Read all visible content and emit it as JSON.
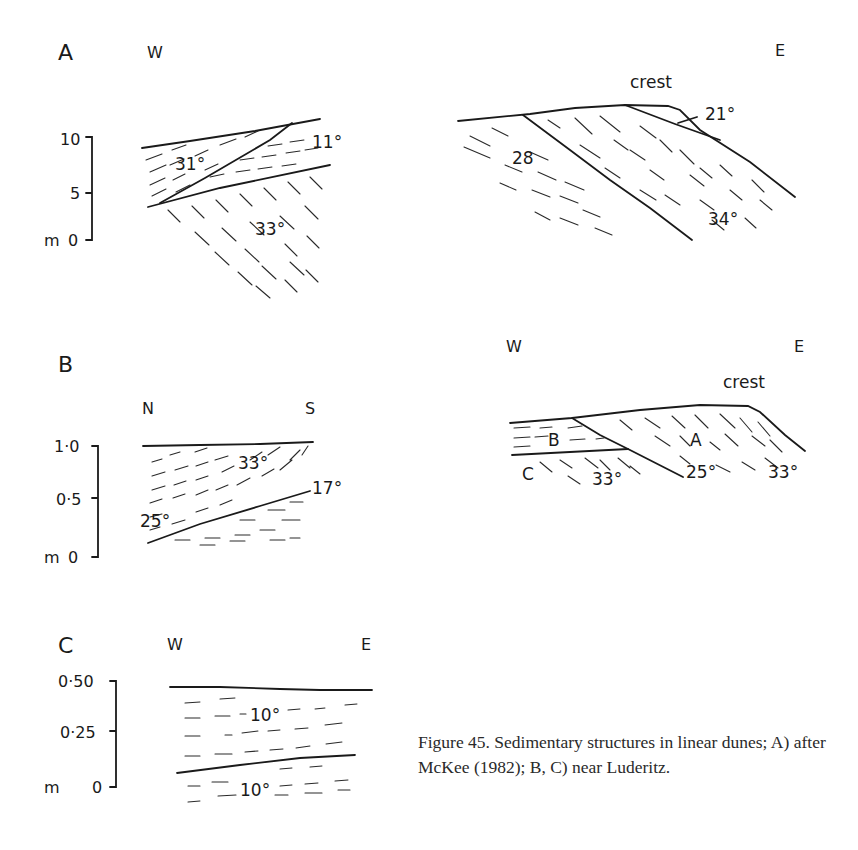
{
  "figure": {
    "caption": "Figure 45. Sedimentary structures in linear dunes; A) after McKee (1982); B, C) near Luderitz.",
    "panels": {
      "A": {
        "label": "A",
        "left_section": {
          "dir_left": "W",
          "scale": {
            "unit": "m",
            "ticks": [
              "10",
              "5",
              "0"
            ]
          },
          "angles": [
            "31°",
            "11°",
            "33°"
          ]
        },
        "right_section": {
          "dir_right": "E",
          "crest_label": "crest",
          "angles": [
            "28",
            "21°",
            "34°"
          ]
        }
      },
      "B": {
        "label": "B",
        "left_section": {
          "dir_left": "N",
          "dir_right": "S",
          "scale": {
            "unit": "m",
            "ticks": [
              "1·0",
              "0·5",
              "0"
            ]
          },
          "angles": [
            "33°",
            "17°",
            "25°"
          ]
        },
        "right_section": {
          "dir_left": "W",
          "dir_right": "E",
          "crest_label": "crest",
          "units": [
            "B",
            "A",
            "C"
          ],
          "angles": [
            "33°",
            "25°",
            "33°"
          ]
        }
      },
      "C": {
        "label": "C",
        "section": {
          "dir_left": "W",
          "dir_right": "E",
          "scale": {
            "unit": "m",
            "ticks": [
              "0·50",
              "0·25",
              "0"
            ]
          },
          "angles": [
            "10°",
            "10°"
          ]
        }
      }
    }
  }
}
